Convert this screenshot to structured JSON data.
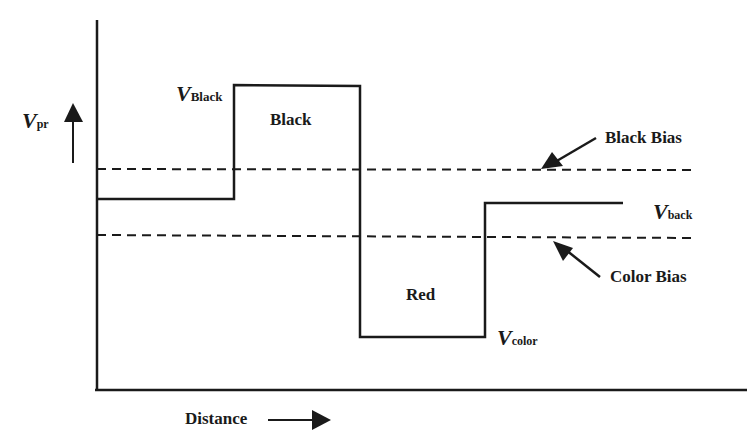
{
  "diagram": {
    "y_axis_label": {
      "symbol": "V",
      "subscript": "pr"
    },
    "x_axis_label": "Distance",
    "levels": {
      "v_black": {
        "symbol": "V",
        "subscript": "Black"
      },
      "v_back": {
        "symbol": "V",
        "subscript": "back"
      },
      "v_color": {
        "symbol": "V",
        "subscript": "color"
      }
    },
    "regions": {
      "black": "Black",
      "red": "Red"
    },
    "bias_lines": {
      "black_bias": "Black Bias",
      "color_bias": "Color Bias"
    },
    "colors": {
      "line": "#1a1a1a",
      "background": "#ffffff"
    }
  }
}
